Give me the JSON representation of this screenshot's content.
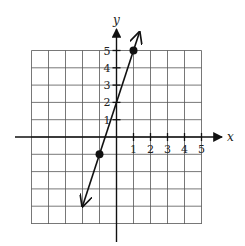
{
  "chart_data": {
    "type": "line",
    "title": "",
    "xlabel": "x",
    "ylabel": "y",
    "xlim": [
      -5,
      5
    ],
    "ylim": [
      -5,
      5
    ],
    "grid": true,
    "x_tick_labels": [
      "1",
      "2",
      "3",
      "4",
      "5"
    ],
    "y_tick_labels": [
      "1",
      "2",
      "3",
      "4",
      "5"
    ],
    "series": [
      {
        "name": "line",
        "equation": "y = 3x + 2",
        "slope": 3,
        "intercept": 2,
        "arrows": "both ends",
        "marked_points": [
          {
            "x": -1,
            "y": -1
          },
          {
            "x": 1,
            "y": 5
          }
        ]
      }
    ]
  },
  "colors": {
    "grid": "#555555",
    "axis": "#111111",
    "line": "#111111",
    "background": "#ffffff"
  }
}
